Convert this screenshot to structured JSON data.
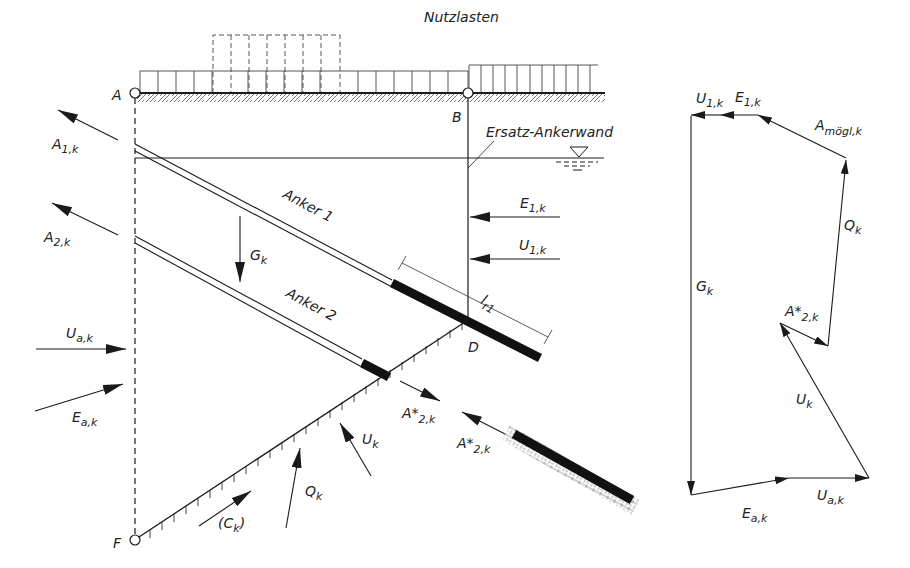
{
  "title": "Nutzlasten",
  "colors": {
    "ink": "#1a1a1a",
    "background": "#ffffff",
    "hatch": "#555555"
  },
  "points": {
    "A": "A",
    "B": "B",
    "D": "D",
    "F": "F"
  },
  "labels": {
    "ersatz_ankerwand": "Ersatz-Ankerwand",
    "anker1": "Anker 1",
    "anker2": "Anker 2",
    "A1k": {
      "main": "A",
      "sub": "1,k"
    },
    "A2k": {
      "main": "A",
      "sub": "2,k"
    },
    "Gk": {
      "main": "G",
      "sub": "k"
    },
    "E1k": {
      "main": "E",
      "sub": "1,k"
    },
    "U1k": {
      "main": "U",
      "sub": "1,k"
    },
    "lr1": {
      "main": "l",
      "sub": "r1"
    },
    "Uak": {
      "main": "U",
      "sub": "a,k"
    },
    "Eak": {
      "main": "E",
      "sub": "a,k"
    },
    "A2star_1": {
      "main": "A*",
      "sub": "2,k"
    },
    "A2star_2": {
      "main": "A*",
      "sub": "2,k"
    },
    "Uk": {
      "main": "U",
      "sub": "k"
    },
    "Qk": {
      "main": "Q",
      "sub": "k"
    },
    "Ck": {
      "main": "(C",
      "sub": "k",
      "close": ")"
    }
  },
  "force_polygon": {
    "labels": {
      "U1k": {
        "main": "U",
        "sub": "1,k"
      },
      "E1k": {
        "main": "E",
        "sub": "1,k"
      },
      "Amoegl": {
        "main": "A",
        "sub": "mögl,k"
      },
      "Qk": {
        "main": "Q",
        "sub": "k"
      },
      "Gk": {
        "main": "G",
        "sub": "k"
      },
      "A2star": {
        "main": "A*",
        "sub": "2,k"
      },
      "Uk": {
        "main": "U",
        "sub": "k"
      },
      "Uak": {
        "main": "U",
        "sub": "a,k"
      },
      "Eak": {
        "main": "E",
        "sub": "a,k"
      }
    }
  }
}
